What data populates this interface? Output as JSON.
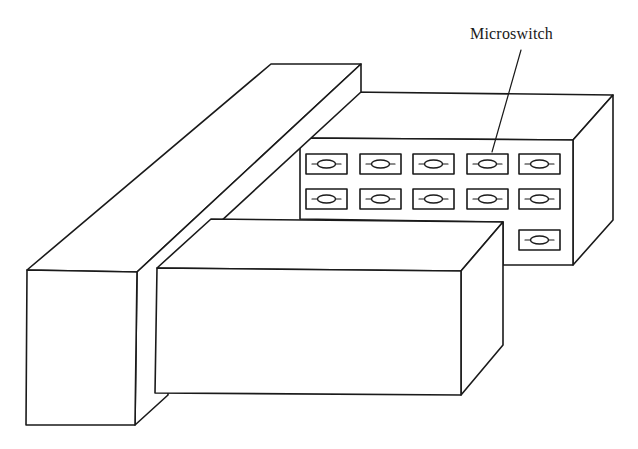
{
  "figure": {
    "labels": [
      {
        "id": "microswitch",
        "text": "Microswitch",
        "x": 470,
        "y": 25
      }
    ],
    "colors": {
      "stroke": "#1a1a1a",
      "fill": "#ffffff",
      "background": "#ffffff"
    },
    "components": [
      {
        "name": "tall-bar",
        "description": "long rectangular bar on the left"
      },
      {
        "name": "switch-housing",
        "description": "box holding microswitches"
      },
      {
        "name": "front-box",
        "description": "low rectangular block in front"
      }
    ],
    "switches": {
      "rows": [
        {
          "y": 154,
          "columns": [
            306,
            360,
            413,
            467,
            519
          ]
        },
        {
          "y": 189,
          "columns": [
            306,
            360,
            413,
            467,
            519
          ]
        },
        {
          "y": 230,
          "columns": [
            519
          ]
        }
      ],
      "width": 41,
      "height": 20,
      "count": 11
    },
    "leader": {
      "from": [
        521,
        50
      ],
      "to": [
        492,
        152
      ]
    }
  }
}
